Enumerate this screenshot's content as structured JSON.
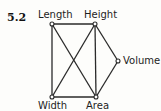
{
  "figure": {
    "number": "5.2",
    "nodes": [
      {
        "id": "length",
        "label": "Length",
        "x": 52,
        "y": 24
      },
      {
        "id": "height",
        "label": "Height",
        "x": 95,
        "y": 24
      },
      {
        "id": "volume",
        "label": "Volume",
        "x": 118,
        "y": 61
      },
      {
        "id": "width",
        "label": "Width",
        "x": 52,
        "y": 97
      },
      {
        "id": "area",
        "label": "Area",
        "x": 96,
        "y": 97
      }
    ],
    "edges": [
      [
        "length",
        "height"
      ],
      [
        "length",
        "width"
      ],
      [
        "length",
        "area"
      ],
      [
        "height",
        "width"
      ],
      [
        "height",
        "area"
      ],
      [
        "height",
        "volume"
      ],
      [
        "width",
        "area"
      ],
      [
        "area",
        "volume"
      ]
    ],
    "colors": {
      "line": "#2a2a2a",
      "node_fill": "#ffffff",
      "text": "#1e1e1e"
    }
  }
}
